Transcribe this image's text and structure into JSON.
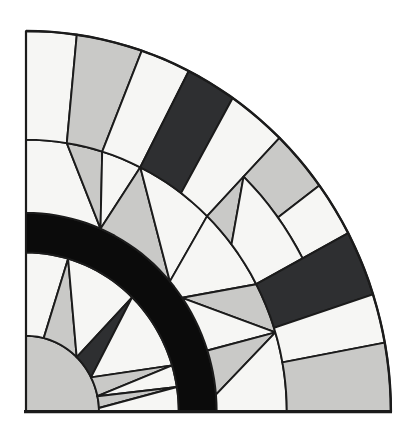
{
  "figure": {
    "canvas": {
      "width": 411,
      "height": 438
    },
    "palette": {
      "white": "#f6f6f4",
      "light": "#c9c9c7",
      "dark": "#2e2f31",
      "black": "#0b0b0b",
      "outline": "#1b1b1b",
      "page": "#ffffff"
    },
    "geometry": {
      "center": {
        "x": 26,
        "y": 412
      },
      "scale_x": 0.973,
      "scale_y": 1.016,
      "radii": {
        "disc": 75,
        "ring_inner": 157,
        "ring_outer": 196,
        "arc_b": 268,
        "arc_c": 322,
        "outer": 375
      },
      "piece_stroke_width": 1.9
    },
    "border": {
      "left": {
        "x1": 26,
        "y1": 31,
        "x2": 26,
        "y2": 413,
        "width": 2.2
      },
      "bottom": {
        "x1": 24,
        "y1": 411.6,
        "x2": 392,
        "y2": 411.6,
        "width": 3.2
      },
      "outer_arc": {
        "r": 375,
        "theta_from": 0,
        "theta_to": 90,
        "width": 2.4
      }
    },
    "pieces": [
      {
        "name": "center-quarter-disc",
        "fill": "light",
        "verts": [
          [
            75,
            0,
            "A"
          ],
          [
            75,
            90,
            "L"
          ],
          [
            0,
            0,
            "L"
          ]
        ]
      },
      {
        "name": "ring-a-white-1",
        "fill": "white",
        "verts": [
          [
            157,
            90,
            "L"
          ],
          [
            75,
            90,
            "A"
          ],
          [
            75,
            76,
            "L"
          ],
          [
            157,
            74,
            "A"
          ]
        ]
      },
      {
        "name": "ring-a-spike-gray-1",
        "fill": "light",
        "verts": [
          [
            75,
            76,
            "A"
          ],
          [
            75,
            46,
            "L"
          ],
          [
            157,
            74,
            "L"
          ]
        ]
      },
      {
        "name": "ring-a-white-2",
        "fill": "white",
        "verts": [
          [
            157,
            74,
            "A"
          ],
          [
            157,
            46,
            "L"
          ],
          [
            75,
            46,
            "L"
          ]
        ]
      },
      {
        "name": "ring-a-spike-dark",
        "fill": "dark",
        "verts": [
          [
            75,
            46,
            "A"
          ],
          [
            75,
            27,
            "L"
          ],
          [
            157,
            46,
            "L"
          ]
        ]
      },
      {
        "name": "ring-a-white-3",
        "fill": "white",
        "verts": [
          [
            157,
            46,
            "A"
          ],
          [
            157,
            17,
            "L"
          ],
          [
            75,
            27,
            "L"
          ]
        ]
      },
      {
        "name": "ring-a-spike-gray-2",
        "fill": "light",
        "verts": [
          [
            75,
            27,
            "A"
          ],
          [
            75,
            12,
            "L"
          ],
          [
            157,
            17,
            "L"
          ]
        ]
      },
      {
        "name": "ring-a-white-4",
        "fill": "white",
        "verts": [
          [
            157,
            17,
            "A"
          ],
          [
            157,
            9,
            "L"
          ],
          [
            75,
            12,
            "L"
          ]
        ]
      },
      {
        "name": "ring-a-spike-gray-3",
        "fill": "light",
        "verts": [
          [
            75,
            12,
            "A"
          ],
          [
            75,
            3,
            "L"
          ],
          [
            157,
            9,
            "L"
          ]
        ]
      },
      {
        "name": "ring-a-white-5",
        "fill": "white",
        "verts": [
          [
            157,
            9,
            "A"
          ],
          [
            157,
            0,
            "L"
          ],
          [
            75,
            0,
            "A"
          ],
          [
            75,
            3,
            "L"
          ]
        ]
      },
      {
        "name": "black-ring",
        "fill": "black",
        "verts": [
          [
            196,
            0,
            "A"
          ],
          [
            196,
            90,
            "L"
          ],
          [
            157,
            90,
            "A"
          ],
          [
            157,
            0,
            "L"
          ]
        ]
      },
      {
        "name": "ring-b-white-1",
        "fill": "white",
        "verts": [
          [
            268,
            90,
            "L"
          ],
          [
            196,
            90,
            "A"
          ],
          [
            196,
            67,
            "L"
          ],
          [
            268,
            81,
            "A"
          ]
        ]
      },
      {
        "name": "ring-b-gray-1",
        "fill": "light",
        "verts": [
          [
            268,
            81,
            "A"
          ],
          [
            268,
            73,
            "L"
          ],
          [
            196,
            67,
            "L"
          ]
        ]
      },
      {
        "name": "ring-b-white-2",
        "fill": "white",
        "verts": [
          [
            268,
            73,
            "A"
          ],
          [
            268,
            64,
            "L"
          ],
          [
            196,
            67,
            "L"
          ]
        ]
      },
      {
        "name": "ring-b-gray-2",
        "fill": "light",
        "verts": [
          [
            196,
            67,
            "A"
          ],
          [
            196,
            41,
            "L"
          ],
          [
            268,
            64,
            "L"
          ]
        ]
      },
      {
        "name": "ring-b-white-3",
        "fill": "white",
        "verts": [
          [
            268,
            64,
            "A"
          ],
          [
            268,
            46,
            "L"
          ],
          [
            196,
            41,
            "L"
          ]
        ]
      },
      {
        "name": "ring-b-white-4",
        "fill": "white",
        "verts": [
          [
            268,
            46,
            "A"
          ],
          [
            268,
            28,
            "L"
          ],
          [
            196,
            35,
            "A"
          ],
          [
            196,
            41,
            "L"
          ]
        ]
      },
      {
        "name": "ring-b-gray-3",
        "fill": "light",
        "verts": [
          [
            268,
            28,
            "A"
          ],
          [
            268,
            17,
            "L"
          ],
          [
            196,
            35,
            "L"
          ]
        ]
      },
      {
        "name": "ring-b-white-5",
        "fill": "white",
        "verts": [
          [
            268,
            17,
            "L"
          ],
          [
            196,
            18,
            "A"
          ],
          [
            196,
            35,
            "L"
          ]
        ]
      },
      {
        "name": "ring-b-gray-4",
        "fill": "light",
        "verts": [
          [
            268,
            17,
            "L"
          ],
          [
            196,
            18,
            "A"
          ],
          [
            196,
            5,
            "L"
          ]
        ]
      },
      {
        "name": "ring-b-white-6",
        "fill": "white",
        "verts": [
          [
            196,
            5,
            "A"
          ],
          [
            196,
            0,
            "L"
          ],
          [
            268,
            0,
            "A"
          ],
          [
            268,
            17,
            "L"
          ]
        ]
      },
      {
        "name": "band-white-1",
        "fill": "white",
        "verts": [
          [
            375,
            90,
            "L"
          ],
          [
            268,
            90,
            "A"
          ],
          [
            268,
            81,
            "L"
          ],
          [
            375,
            82,
            "A"
          ]
        ]
      },
      {
        "name": "band-gray-1",
        "fill": "light",
        "verts": [
          [
            375,
            82,
            "L"
          ],
          [
            268,
            81,
            "A"
          ],
          [
            268,
            73,
            "L"
          ],
          [
            375,
            71.5,
            "A"
          ]
        ]
      },
      {
        "name": "band-white-2",
        "fill": "white",
        "verts": [
          [
            375,
            71.5,
            "L"
          ],
          [
            268,
            73,
            "A"
          ],
          [
            268,
            64,
            "L"
          ],
          [
            375,
            63.5,
            "A"
          ]
        ]
      },
      {
        "name": "band-dark-1",
        "fill": "dark",
        "verts": [
          [
            375,
            63.5,
            "L"
          ],
          [
            268,
            64,
            "A"
          ],
          [
            268,
            53.5,
            "L"
          ],
          [
            375,
            55.5,
            "A"
          ]
        ]
      },
      {
        "name": "band-white-3",
        "fill": "white",
        "verts": [
          [
            375,
            55.5,
            "L"
          ],
          [
            268,
            53.5,
            "A"
          ],
          [
            268,
            46,
            "L"
          ],
          [
            375,
            46,
            "A"
          ]
        ]
      },
      {
        "name": "band-outer-gray",
        "fill": "light",
        "verts": [
          [
            375,
            46,
            "L"
          ],
          [
            322,
            46,
            "A"
          ],
          [
            322,
            36.5,
            "L"
          ],
          [
            375,
            36.5,
            "A"
          ]
        ]
      },
      {
        "name": "band-outer-white",
        "fill": "white",
        "verts": [
          [
            375,
            36.5,
            "L"
          ],
          [
            322,
            36.5,
            "A"
          ],
          [
            322,
            28,
            "L"
          ],
          [
            375,
            28,
            "A"
          ]
        ]
      },
      {
        "name": "band-inner-gray",
        "fill": "light",
        "verts": [
          [
            322,
            46,
            "L"
          ],
          [
            268,
            46,
            "A"
          ],
          [
            268,
            38,
            "L"
          ]
        ]
      },
      {
        "name": "band-inner-white",
        "fill": "white",
        "verts": [
          [
            268,
            38,
            "A"
          ],
          [
            268,
            28,
            "L"
          ],
          [
            322,
            28,
            "A"
          ],
          [
            322,
            46,
            "L"
          ]
        ]
      },
      {
        "name": "band-dark-2",
        "fill": "dark",
        "verts": [
          [
            375,
            28,
            "L"
          ],
          [
            268,
            28,
            "A"
          ],
          [
            268,
            18,
            "L"
          ],
          [
            375,
            18,
            "A"
          ]
        ]
      },
      {
        "name": "band-white-4",
        "fill": "white",
        "verts": [
          [
            375,
            18,
            "L"
          ],
          [
            268,
            18,
            "A"
          ],
          [
            268,
            10.5,
            "L"
          ],
          [
            375,
            10.5,
            "A"
          ]
        ]
      },
      {
        "name": "band-gray-2",
        "fill": "light",
        "verts": [
          [
            375,
            10.5,
            "L"
          ],
          [
            268,
            10.5,
            "A"
          ],
          [
            268,
            0,
            "L"
          ],
          [
            375,
            0,
            "A"
          ]
        ]
      }
    ]
  }
}
